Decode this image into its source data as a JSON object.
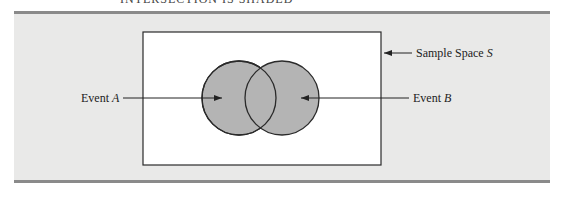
{
  "figure": {
    "caption_partial": "INTERSECTION IS SHADED",
    "labels": {
      "sample_space": "Sample Space ",
      "sample_space_var": "S",
      "event_a": "Event ",
      "event_a_var": "A",
      "event_b": "Event ",
      "event_b_var": "B"
    },
    "colors": {
      "panel_bg": "#e9e9e8",
      "panel_rule": "#8a8a8a",
      "sample_space_fill": "#ffffff",
      "circle_fill": "#b4b4b4",
      "stroke": "#2a2a2a"
    },
    "shapes": {
      "sample_space_rect": {
        "x": 143,
        "y": 32,
        "w": 238,
        "h": 133
      },
      "circle_a": {
        "cx": 239,
        "cy": 98,
        "r": 37
      },
      "circle_b": {
        "cx": 282,
        "cy": 98,
        "r": 37
      }
    }
  }
}
